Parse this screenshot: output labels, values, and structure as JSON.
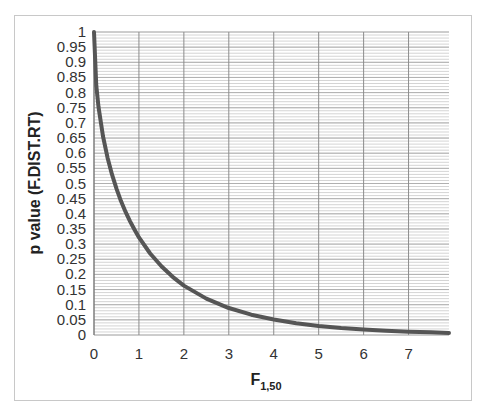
{
  "chart_data": {
    "type": "line",
    "title": "",
    "xlabel": "F",
    "xlabel_subscript": "1,50",
    "ylabel": "p value (F.DIST.RT)",
    "xlim": [
      0,
      7.9
    ],
    "ylim": [
      0,
      1
    ],
    "x_ticks": [
      0,
      1,
      2,
      3,
      4,
      5,
      6,
      7
    ],
    "x_tick_labels": [
      "0",
      "1",
      "2",
      "3",
      "4",
      "5",
      "6",
      "7"
    ],
    "y_ticks": [
      0,
      0.05,
      0.1,
      0.15,
      0.2,
      0.25,
      0.3,
      0.35,
      0.4,
      0.45,
      0.5,
      0.55,
      0.6,
      0.65,
      0.7,
      0.75,
      0.8,
      0.85,
      0.9,
      0.95,
      1
    ],
    "y_tick_labels": [
      "0",
      "0.05",
      "0.1",
      "0.15",
      "0.2",
      "0.25",
      "0.3",
      "0.35",
      "0.4",
      "0.45",
      "0.5",
      "0.55",
      "0.6",
      "0.65",
      "0.7",
      "0.75",
      "0.8",
      "0.85",
      "0.9",
      "0.95",
      "1"
    ],
    "grid": true,
    "minor_y_grid_step": 0.01,
    "legend": "none",
    "series": [
      {
        "name": "F.DIST.RT(x,1,50)",
        "color": "#555555",
        "x": [
          0,
          0.05,
          0.1,
          0.2,
          0.3,
          0.4,
          0.5,
          0.6,
          0.7,
          0.8,
          0.9,
          1,
          1.25,
          1.5,
          1.75,
          2,
          2.5,
          3,
          3.5,
          4,
          4.5,
          5,
          5.5,
          6,
          6.5,
          7,
          7.5,
          7.9
        ],
        "y": [
          1,
          0.824,
          0.753,
          0.656,
          0.586,
          0.53,
          0.483,
          0.442,
          0.407,
          0.376,
          0.348,
          0.322,
          0.269,
          0.227,
          0.192,
          0.163,
          0.12,
          0.089,
          0.067,
          0.051,
          0.039,
          0.03,
          0.023,
          0.018,
          0.014,
          0.011,
          0.009,
          0.007
        ]
      }
    ]
  }
}
